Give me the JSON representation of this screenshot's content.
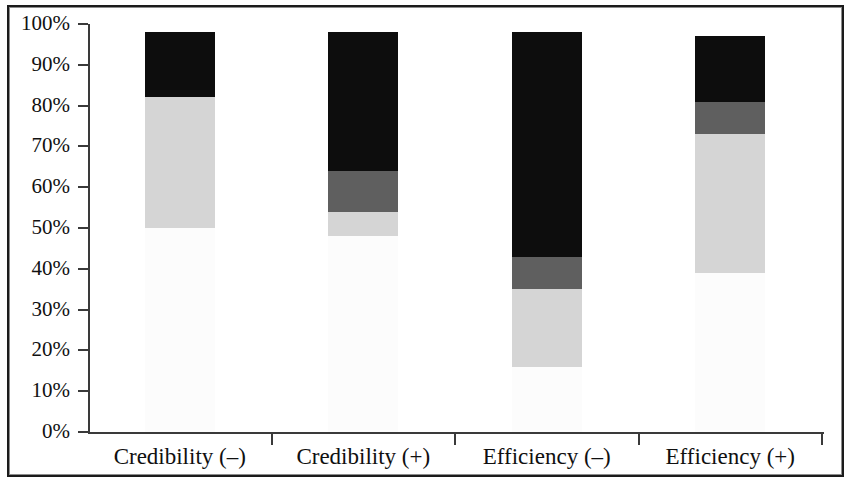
{
  "chart_data": {
    "type": "bar",
    "subtype": "stacked-bar-100-percent",
    "title": "",
    "subtitle": "",
    "xlabel": "",
    "ylabel": "",
    "categories": [
      "Credibility (–)",
      "Credibility (+)",
      "Efficiency (–)",
      "Efficiency (+)"
    ],
    "ylim": [
      0,
      100
    ],
    "y_tick_labels": [
      "100%",
      "90%",
      "80%",
      "70%",
      "60%",
      "50%",
      "40%",
      "30%",
      "20%",
      "10%",
      "0%"
    ],
    "y_tick_values": [
      100,
      90,
      80,
      70,
      60,
      50,
      40,
      30,
      20,
      10,
      0
    ],
    "grid": false,
    "legend": "none",
    "series": [
      {
        "name": "segment-1-white",
        "color": "#fcfcfc",
        "values": [
          50,
          48,
          16,
          39
        ]
      },
      {
        "name": "segment-2-light-gray",
        "color": "#d5d5d5",
        "values": [
          32,
          6,
          19,
          34
        ]
      },
      {
        "name": "segment-3-dark-gray",
        "color": "#5f5f5f",
        "values": [
          0,
          10,
          8,
          8
        ]
      },
      {
        "name": "segment-4-black",
        "color": "#0d0d0d",
        "values": [
          16,
          34,
          55,
          16
        ]
      }
    ],
    "bar_totals": [
      98,
      98,
      98,
      97
    ],
    "cumulative_tops": [
      [
        50,
        82,
        82,
        98
      ],
      [
        48,
        54,
        64,
        98
      ],
      [
        16,
        35,
        43,
        98
      ],
      [
        39,
        73,
        81,
        97
      ]
    ]
  },
  "axis": {
    "y_labels": [
      {
        "text": "100%",
        "value": 100
      },
      {
        "text": "90%",
        "value": 90
      },
      {
        "text": "80%",
        "value": 80
      },
      {
        "text": "70%",
        "value": 70
      },
      {
        "text": "60%",
        "value": 60
      },
      {
        "text": "50%",
        "value": 50
      },
      {
        "text": "40%",
        "value": 40
      },
      {
        "text": "30%",
        "value": 30
      },
      {
        "text": "20%",
        "value": 20
      },
      {
        "text": "10%",
        "value": 10
      },
      {
        "text": "0%",
        "value": 0
      }
    ],
    "x_labels": [
      "Credibility (–)",
      "Credibility (+)",
      "Efficiency (–)",
      "Efficiency (+)"
    ]
  },
  "colors": {
    "segment_1": "#fcfcfc",
    "segment_2": "#d5d5d5",
    "segment_3": "#5f5f5f",
    "segment_4": "#0d0d0d",
    "axis": "#3a3a3a",
    "text": "#101010",
    "page_border": "#1b1b1b",
    "background": "#ffffff"
  }
}
